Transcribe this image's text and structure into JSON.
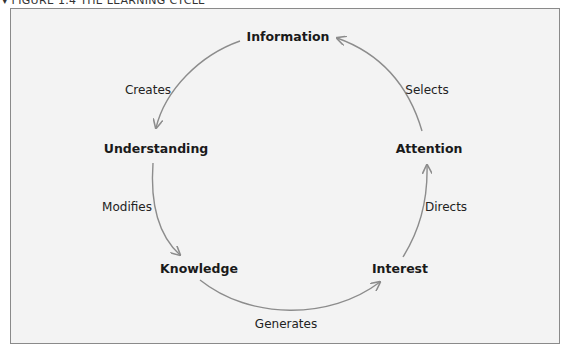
{
  "figure": {
    "title": "▾ FIGURE 1.4  THE LEARNING CYCLE"
  },
  "diagram": {
    "type": "cycle",
    "nodes": [
      {
        "id": "information",
        "label": "Information"
      },
      {
        "id": "understanding",
        "label": "Understanding"
      },
      {
        "id": "knowledge",
        "label": "Knowledge"
      },
      {
        "id": "interest",
        "label": "Interest"
      },
      {
        "id": "attention",
        "label": "Attention"
      }
    ],
    "edges": [
      {
        "from": "information",
        "to": "understanding",
        "label": "Creates"
      },
      {
        "from": "understanding",
        "to": "knowledge",
        "label": "Modifies"
      },
      {
        "from": "knowledge",
        "to": "interest",
        "label": "Generates"
      },
      {
        "from": "interest",
        "to": "attention",
        "label": "Directs"
      },
      {
        "from": "attention",
        "to": "information",
        "label": "Selects"
      }
    ],
    "colors": {
      "background": "#f3f3f3",
      "border": "#8a8a8a",
      "arrow": "#8c8c8c",
      "text": "#1a1a1a"
    }
  }
}
